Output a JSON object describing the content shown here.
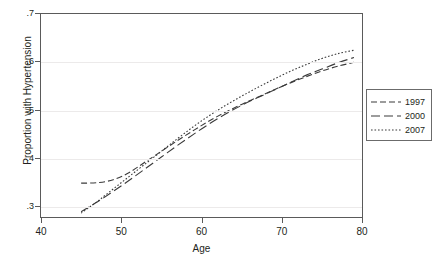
{
  "chart_data": {
    "type": "line",
    "title": "",
    "xlabel": "Age",
    "ylabel": "Proportion with Hypertension",
    "xlim": [
      40,
      80
    ],
    "ylim": [
      0.28,
      0.7
    ],
    "xticks": [
      40,
      50,
      60,
      70,
      80
    ],
    "xticklabels": [
      "40",
      "50",
      "60",
      "70",
      "80"
    ],
    "yticks": [
      0.3,
      0.4,
      0.5,
      0.6,
      0.7
    ],
    "yticklabels": [
      ".3",
      ".4",
      ".5",
      ".6",
      ".7"
    ],
    "grid": "horizontal",
    "legend_position": "right-outside",
    "x": [
      45,
      47,
      49,
      51,
      53,
      55,
      57,
      59,
      61,
      63,
      65,
      67,
      69,
      71,
      73,
      75,
      77,
      79
    ],
    "series": [
      {
        "name": "1997",
        "dash": "medium-dash",
        "color": "#3a3a3a",
        "values": [
          0.35,
          0.351,
          0.357,
          0.372,
          0.394,
          0.416,
          0.438,
          0.459,
          0.479,
          0.497,
          0.513,
          0.528,
          0.543,
          0.557,
          0.57,
          0.582,
          0.592,
          0.6
        ]
      },
      {
        "name": "2000",
        "dash": "long-dash",
        "color": "#3a3a3a",
        "values": [
          0.291,
          0.311,
          0.333,
          0.356,
          0.38,
          0.404,
          0.428,
          0.451,
          0.473,
          0.493,
          0.511,
          0.527,
          0.542,
          0.558,
          0.573,
          0.586,
          0.599,
          0.61
        ]
      },
      {
        "name": "2007",
        "dash": "dotted",
        "color": "#3a3a3a",
        "values": [
          0.288,
          0.312,
          0.338,
          0.364,
          0.39,
          0.416,
          0.442,
          0.467,
          0.49,
          0.511,
          0.53,
          0.548,
          0.565,
          0.581,
          0.595,
          0.608,
          0.618,
          0.625
        ]
      }
    ]
  },
  "legend": {
    "entries": [
      {
        "label": "1997"
      },
      {
        "label": "2000"
      },
      {
        "label": "2007"
      }
    ]
  }
}
